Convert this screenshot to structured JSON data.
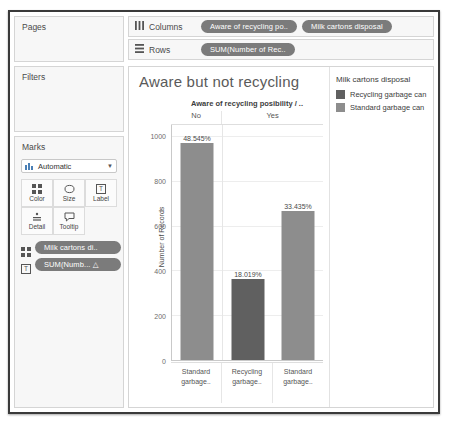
{
  "left_panel": {
    "pages": {
      "title": "Pages"
    },
    "filters": {
      "title": "Filters"
    },
    "marks": {
      "title": "Marks",
      "mark_type": "Automatic",
      "mark_type_icon": "bar-chart-icon",
      "caret_icon": "chevron-down-icon",
      "buttons": [
        {
          "label": "Color",
          "icon": "color-squares-icon"
        },
        {
          "label": "Size",
          "icon": "size-icon"
        },
        {
          "label": "Label",
          "icon": "label-text-icon"
        },
        {
          "label": "Detail",
          "icon": "detail-icon"
        },
        {
          "label": "Tooltip",
          "icon": "tooltip-icon"
        }
      ],
      "pills": [
        {
          "label": "Milk cartons di..",
          "icon": "color-squares-icon"
        },
        {
          "label": "SUM(Numb...  △",
          "icon": "label-text-icon"
        }
      ]
    }
  },
  "shelves": {
    "columns": {
      "label": "Columns",
      "icon": "columns-icon",
      "pills": [
        "Aware of recycling po..",
        "Milk cartons disposal"
      ]
    },
    "rows": {
      "label": "Rows",
      "icon": "rows-icon",
      "pills": [
        "SUM(Number of Rec.."
      ]
    }
  },
  "legend": {
    "title": "Milk cartons disposal",
    "items": [
      {
        "label": "Recycling garbage can",
        "color": "#606060"
      },
      {
        "label": "Standard garbage can",
        "color": "#8d8d8d"
      }
    ]
  },
  "chart_data": {
    "type": "bar",
    "title": "Aware but not recycling",
    "column_header_title": "Aware of recycling posibility / ..",
    "column_groups": [
      "No",
      "Yes"
    ],
    "ylabel": "Number of Records",
    "xlabel": "",
    "ylim": [
      0,
      1050
    ],
    "yticks": [
      0,
      200,
      400,
      600,
      800,
      1000
    ],
    "grid": true,
    "legend_position": "right",
    "categories": [
      "Standard garbage..",
      "Recycling garbage..",
      "Standard garbage.."
    ],
    "series": [
      {
        "name": "Number of Records",
        "values": [
          970,
          360,
          668
        ],
        "labels": [
          "48.545%",
          "18.019%",
          "33.435%"
        ],
        "colors": [
          "#8d8d8d",
          "#606060",
          "#8d8d8d"
        ],
        "groups": [
          "No",
          "Yes",
          "Yes"
        ]
      }
    ]
  },
  "colors": {
    "pill": "#7b7b7b",
    "panel_bg": "#f7f7f7",
    "border": "#d5d5d5"
  }
}
